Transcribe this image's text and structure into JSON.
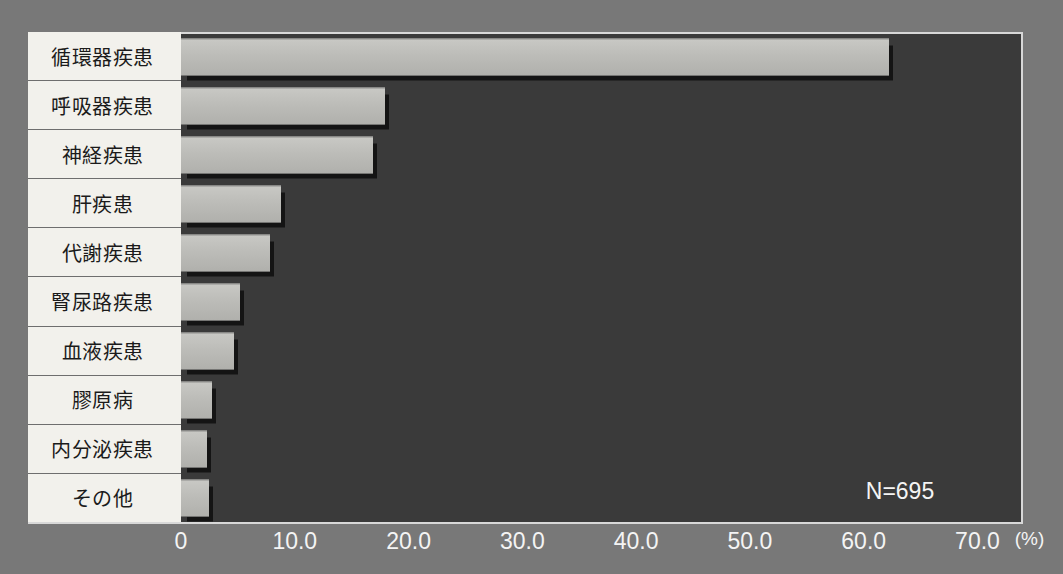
{
  "chart_data": {
    "type": "bar",
    "orientation": "horizontal",
    "title": "",
    "xlabel": "(%)",
    "ylabel": "",
    "xlim": [
      0,
      70
    ],
    "grid": false,
    "legend": false,
    "annotation": "N=695",
    "unit_label": "(%)",
    "xticks": [
      "0",
      "10.0",
      "20.0",
      "30.0",
      "40.0",
      "50.0",
      "60.0",
      "70.0"
    ],
    "xtick_values": [
      0,
      10,
      20,
      30,
      40,
      50,
      60,
      70
    ],
    "categories": [
      "循環器疾患",
      "呼吸器疾患",
      "神経疾患",
      "肝疾患",
      "代謝疾患",
      "腎尿路疾患",
      "血液疾患",
      "膠原病",
      "内分泌疾患",
      "その他"
    ],
    "values": [
      62.2,
      17.9,
      16.9,
      8.8,
      7.8,
      5.2,
      4.7,
      2.7,
      2.3,
      2.5
    ],
    "bar_color": "#bcbcb8",
    "plot_background": "#3a3a3a",
    "label_background": "#f2f1ec",
    "axis_color": "#d8d8d8",
    "text_color": "#f4f4f4",
    "page_background": "#787878"
  }
}
